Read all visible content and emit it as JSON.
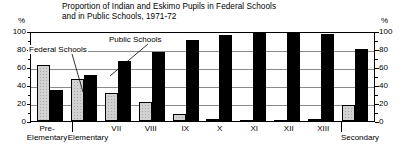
{
  "title": {
    "line1": "Proportion of Indian and Eskimo Pupils in Federal Schools",
    "line2": "and in Public Schools, 1971-72"
  },
  "axis": {
    "unit_left": "%",
    "unit_right": "%",
    "ticks": [
      "100",
      "80",
      "60",
      "40",
      "20",
      "0"
    ]
  },
  "annotations": {
    "federal": "Federal Schools",
    "public": "Public Schools"
  },
  "category_labels": {
    "pre_elementary_line1": "Pre-",
    "pre_elementary_line2": "Elementary",
    "elementary": "Elementary",
    "secondary": "Secondary"
  },
  "chart_data": {
    "type": "bar",
    "title": "Proportion of Indian and Eskimo Pupils in Federal Schools and in Public Schools, 1971-72",
    "xlabel": "",
    "ylabel": "%",
    "ylim": [
      0,
      100
    ],
    "yticks": [
      0,
      20,
      40,
      60,
      80,
      100
    ],
    "grid": true,
    "legend": "annotated on plot",
    "categories": [
      "Pre-Elementary",
      "Elementary",
      "VII",
      "VIII",
      "IX",
      "X",
      "XI",
      "XII",
      "XIII",
      "Secondary"
    ],
    "series": [
      {
        "name": "Federal Schools",
        "values": [
          64,
          48,
          32,
          22,
          8,
          2,
          1,
          1,
          2,
          18
        ]
      },
      {
        "name": "Public Schools",
        "values": [
          35,
          52,
          68,
          78,
          92,
          98,
          100,
          100,
          99,
          82
        ]
      }
    ]
  }
}
